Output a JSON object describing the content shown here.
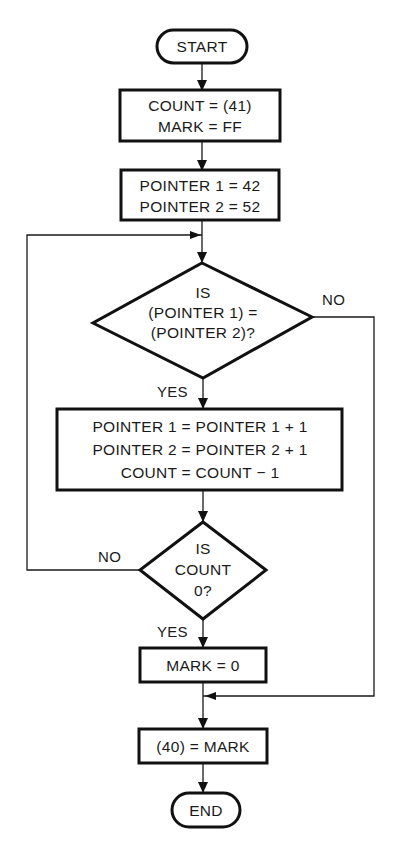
{
  "flowchart": {
    "start": {
      "label": "START"
    },
    "init_count": {
      "lines": [
        "COUNT = (41)",
        "MARK = FF"
      ]
    },
    "init_pointers": {
      "lines": [
        "POINTER 1 = 42",
        "POINTER 2 = 52"
      ]
    },
    "compare_decision": {
      "lines": [
        "IS",
        "(POINTER 1) =",
        "(POINTER 2)?"
      ],
      "yes_label": "YES",
      "no_label": "NO"
    },
    "increment": {
      "lines": [
        "POINTER 1 = POINTER 1 + 1",
        "POINTER 2 = POINTER 2 + 1",
        "COUNT = COUNT − 1"
      ]
    },
    "count_decision": {
      "lines": [
        "IS",
        "COUNT",
        "0?"
      ],
      "yes_label": "YES",
      "no_label": "NO"
    },
    "mark_zero": {
      "label": "MARK = 0"
    },
    "store_mark": {
      "label": "(40) = MARK"
    },
    "end": {
      "label": "END"
    }
  }
}
